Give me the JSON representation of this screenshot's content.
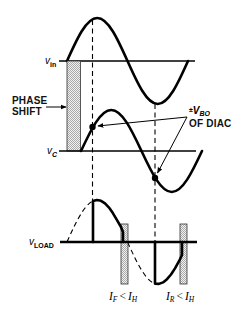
{
  "figure": {
    "waveforms": {
      "v_in": {
        "symbol": "v",
        "subscript": "in"
      },
      "v_C": {
        "symbol": "v",
        "subscript": "C"
      },
      "v_LOAD": {
        "symbol": "v",
        "subscript": "LOAD"
      }
    },
    "annotations": {
      "phase_shift": {
        "line1": "PHASE",
        "line2": "SHIFT"
      },
      "breakover": {
        "prefix": "±",
        "symbol": "V",
        "subscript": "BO",
        "line2": "OF DIAC"
      },
      "forward_hold": {
        "left_symbol": "I",
        "left_sub": "F",
        "operator": "<",
        "right_symbol": "I",
        "right_sub": "H"
      },
      "reverse_hold": {
        "left_symbol": "I",
        "left_sub": "R",
        "operator": "<",
        "right_symbol": "I",
        "right_sub": "H"
      }
    }
  },
  "colors": {
    "stroke": "#000000",
    "stipple": "#b5b5b5",
    "background": "#ffffff"
  }
}
